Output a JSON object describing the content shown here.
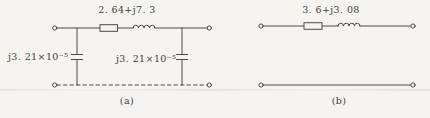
{
  "figure": {
    "type": "circuit-diagram",
    "colors": {
      "background": "#f5f4f0",
      "line": "#4a4a4a",
      "text": "#3c3c3c"
    },
    "circuits": [
      {
        "name": "pi-equivalent-network",
        "series_impedance": "2. 64+j7. 3",
        "shunt_admittance_left": "j3. 21×10⁻⁵",
        "shunt_admittance_right": "j3. 21×10⁻⁵",
        "caption": "(a)"
      },
      {
        "name": "series-impedance-network",
        "series_impedance": "3. 6+j3. 08",
        "caption": "(b)"
      }
    ]
  }
}
